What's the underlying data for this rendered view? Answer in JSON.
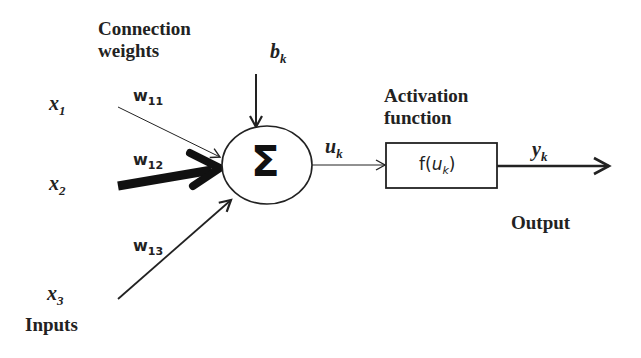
{
  "diagram": {
    "title_labels": {
      "connection_weights_line1": "Connection",
      "connection_weights_line2": "weights",
      "activation_line1": "Activation",
      "activation_line2": "function",
      "output": "Output",
      "inputs": "Inputs"
    },
    "inputs": [
      {
        "base": "x",
        "sub": "1"
      },
      {
        "base": "x",
        "sub": "2"
      },
      {
        "base": "x",
        "sub": "3"
      }
    ],
    "weights": [
      {
        "base": "w",
        "sub": "11"
      },
      {
        "base": "w",
        "sub": "12"
      },
      {
        "base": "w",
        "sub": "13"
      }
    ],
    "bias": {
      "base": "b",
      "sub": "k"
    },
    "summation_symbol": "Σ",
    "net_input": {
      "base": "u",
      "sub": "k"
    },
    "activation_box": {
      "prefix": "f(",
      "base": "u",
      "sub": "k",
      "suffix": ")"
    },
    "output_var": {
      "base": "y",
      "sub": "k"
    },
    "colors": {
      "stroke": "#222222",
      "background": "#ffffff"
    }
  }
}
